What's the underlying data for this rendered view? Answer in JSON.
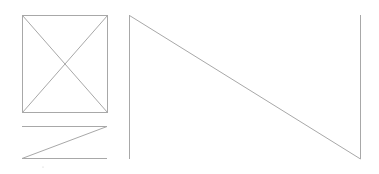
{
  "canvas": {
    "width": 379,
    "height": 174,
    "background": "#ffffff"
  },
  "colors": {
    "stroke": "#a8a8a8"
  },
  "image_placeholder": {
    "x1": 22,
    "y1": 15,
    "x2": 107,
    "y2": 112
  },
  "text_placeholder": {
    "x1": 22,
    "y1": 126,
    "x2": 107,
    "y2": 158
  },
  "large_shape": {
    "x1": 129,
    "y1": 15,
    "x2": 360,
    "y2": 159
  },
  "dot": {
    "x": 43,
    "y": 167
  }
}
